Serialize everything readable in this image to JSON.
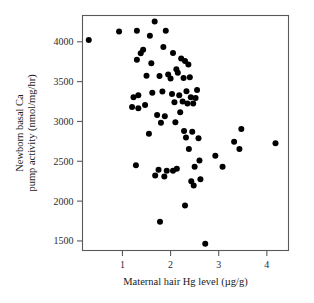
{
  "figure": {
    "background_color": "#ffffff",
    "frame_color": "#5a5a5a",
    "point_color": "#000000"
  },
  "chart_data": {
    "type": "scatter",
    "title": "",
    "xlabel": "Maternal hair Hg level (µg/g)",
    "ylabel_line1": "Newborn basal Ca",
    "ylabel_line2": "pump activity (nmol/mg/hr)",
    "ylabel": "Newborn basal Ca pump activity (nmol/mg/hr)",
    "xlim": [
      0.17,
      4.45
    ],
    "ylim": [
      1380,
      4330
    ],
    "xticks": [
      1,
      2,
      3,
      4
    ],
    "xtick_labels": [
      "1",
      "2",
      "3",
      "4"
    ],
    "yticks": [
      1500,
      2000,
      2500,
      3000,
      3500,
      4000
    ],
    "ytick_labels": [
      "1500",
      "2000",
      "2500",
      "3000",
      "3500",
      "4000"
    ],
    "grid": false,
    "legend": false,
    "marker": "filled-circle",
    "marker_size_px": 3.0,
    "n_points": 72,
    "x": [
      0.3,
      0.93,
      1.3,
      1.67,
      1.9,
      1.57,
      1.3,
      1.43,
      1.6,
      1.85,
      2.05,
      2.22,
      1.23,
      1.5,
      1.95,
      2.12,
      2.3,
      2.37,
      1.38,
      1.77,
      2.0,
      2.15,
      2.27,
      2.4,
      1.2,
      1.62,
      1.83,
      2.03,
      2.18,
      2.33,
      1.33,
      1.47,
      1.72,
      1.88,
      2.08,
      2.25,
      2.42,
      2.52,
      2.47,
      2.35,
      2.2,
      2.55,
      1.28,
      1.55,
      1.8,
      2.1,
      2.28,
      2.45,
      2.58,
      2.93,
      1.68,
      1.92,
      2.13,
      2.38,
      2.6,
      2.5,
      2.32,
      2.05,
      1.75,
      2.43,
      2.62,
      2.48,
      3.08,
      3.32,
      3.47,
      3.43,
      4.18,
      1.33,
      1.78,
      1.87,
      2.3,
      2.72
    ],
    "y": [
      4022,
      4128,
      4140,
      4255,
      4140,
      4075,
      3775,
      3900,
      3730,
      3935,
      3860,
      3790,
      3305,
      3575,
      3590,
      3655,
      3760,
      3715,
      3855,
      3570,
      3540,
      3610,
      3545,
      3555,
      3180,
      3360,
      3375,
      3345,
      3330,
      3380,
      3330,
      3205,
      3080,
      3065,
      3240,
      3250,
      3305,
      3295,
      3225,
      3225,
      3115,
      3395,
      2450,
      2845,
      2985,
      2990,
      2880,
      2870,
      2790,
      2570,
      2320,
      2380,
      2405,
      2655,
      2510,
      2430,
      2800,
      2380,
      2395,
      2250,
      2275,
      2195,
      2430,
      2745,
      2905,
      2655,
      2725,
      3165,
      1740,
      2310,
      1945,
      1465
    ]
  }
}
